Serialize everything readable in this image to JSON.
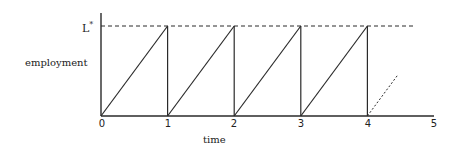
{
  "chart_data": {
    "type": "line",
    "title": "",
    "xlabel": "time",
    "ylabel": "employment",
    "y_reference_label": "L*",
    "xlim": [
      0,
      5
    ],
    "x_ticks": [
      "0",
      "1",
      "2",
      "3",
      "4",
      "5"
    ],
    "grid": false,
    "series": [
      {
        "name": "employment (sawtooth)",
        "style": "solid",
        "points": [
          [
            0,
            0
          ],
          [
            1,
            1
          ],
          [
            1,
            0
          ],
          [
            2,
            1
          ],
          [
            2,
            0
          ],
          [
            3,
            1
          ],
          [
            3,
            0
          ],
          [
            4,
            1
          ],
          [
            4,
            0
          ]
        ]
      },
      {
        "name": "L* ceiling",
        "style": "dashed",
        "points": [
          [
            0,
            1
          ],
          [
            4.7,
            1
          ]
        ]
      },
      {
        "name": "continuation",
        "style": "dotted",
        "points": [
          [
            4,
            0
          ],
          [
            4.45,
            0.45
          ]
        ]
      }
    ]
  },
  "labels": {
    "ylabel": "employment",
    "xlabel": "time",
    "lstar_base": "L",
    "lstar_sup": "*",
    "ticks": [
      "0",
      "1",
      "2",
      "3",
      "4",
      "5"
    ]
  }
}
